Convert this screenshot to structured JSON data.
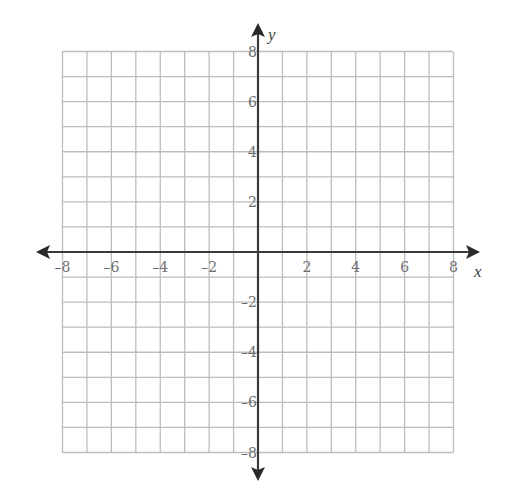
{
  "chart_data": {
    "type": "coordinate-grid",
    "title": "",
    "xlabel": "x",
    "ylabel": "y",
    "xlim": [
      -8,
      8
    ],
    "ylim": [
      -8,
      8
    ],
    "grid": true,
    "grid_step": 1,
    "x_ticks": [
      -8,
      -6,
      -4,
      -2,
      2,
      4,
      6,
      8
    ],
    "y_ticks": [
      8,
      6,
      4,
      2,
      -2,
      -4,
      -6,
      -8
    ],
    "x_tick_labels": [
      "–8",
      "–6",
      "–4",
      "–2",
      "2",
      "4",
      "6",
      "8"
    ],
    "y_tick_labels": [
      "8",
      "6",
      "4",
      "2",
      "–2",
      "–4",
      "–6",
      "–8"
    ],
    "series": []
  },
  "colors": {
    "grid": "#bdbdbd",
    "axis": "#3a3a3a",
    "tick_text": "#6e6e6e"
  }
}
